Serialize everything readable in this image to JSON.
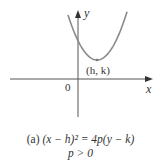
{
  "figure": {
    "axis_x_label": "x",
    "axis_y_label": "y",
    "origin_label": "0",
    "vertex_label": "(h, k)",
    "caption_prefix": "(a)",
    "caption_equation": "(x − h)² = 4p(y − k)",
    "caption_condition": "p > 0",
    "colors": {
      "curve": "#8a8a8a",
      "axes": "#555555",
      "text": "#333333"
    }
  }
}
